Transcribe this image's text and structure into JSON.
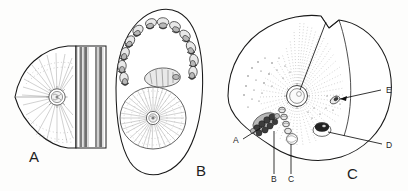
{
  "figure": {
    "background_color": "#fdfdfc",
    "ink_color": "#1a1a1a",
    "width": 408,
    "height": 191
  },
  "panels": [
    {
      "id": "A",
      "label": "A",
      "label_x": 29,
      "label_y": 162,
      "description": "Lateral view of specimen with vertical banded margin and radiating stipple field around a central rosette"
    },
    {
      "id": "B",
      "label": "B",
      "label_x": 196,
      "label_y": 176,
      "description": "Ovate outline with arc of paired appendage clusters around upper margin and large radiating disc below"
    },
    {
      "id": "C",
      "label": "C",
      "label_x": 352,
      "label_y": 177,
      "description": "Rounded outline with notched upper right lobe, central radiating stipple fan, and five labelled structures"
    }
  ],
  "callouts": [
    {
      "letter": "A",
      "x": 236,
      "y": 140,
      "target_x": 261,
      "target_y": 127,
      "panel": "C"
    },
    {
      "letter": "B",
      "x": 274,
      "y": 180,
      "target_x": 274,
      "target_y": 131,
      "panel": "C"
    },
    {
      "letter": "C",
      "x": 291,
      "y": 180,
      "target_x": 290,
      "target_y": 139,
      "panel": "C"
    },
    {
      "letter": "D",
      "x": 389,
      "y": 146,
      "target_x": 322,
      "target_y": 131,
      "panel": "C"
    },
    {
      "letter": "E",
      "x": 388,
      "y": 92,
      "target_x": 337,
      "target_y": 100,
      "panel": "C"
    }
  ],
  "colors": {
    "ink": "#1a1a1a",
    "hair": "#555555",
    "hair_light": "#8a8a8a",
    "organ_fill": "#e9e9e9",
    "organ_dark": "#3c3c3c",
    "organ_mid": "#b8b8b8",
    "paper": "#fdfdfc"
  }
}
